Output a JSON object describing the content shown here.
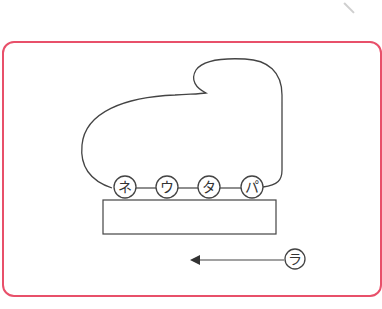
{
  "diagram": {
    "frame_color": "#e8506a",
    "line_color": "#444444",
    "wheels": [
      {
        "label": "ネ",
        "cx": 125,
        "cy": 187
      },
      {
        "label": "ウ",
        "cx": 167,
        "cy": 187
      },
      {
        "label": "タ",
        "cx": 209,
        "cy": 187
      },
      {
        "label": "パ",
        "cx": 252,
        "cy": 187
      }
    ],
    "direction_label": "ラ"
  }
}
